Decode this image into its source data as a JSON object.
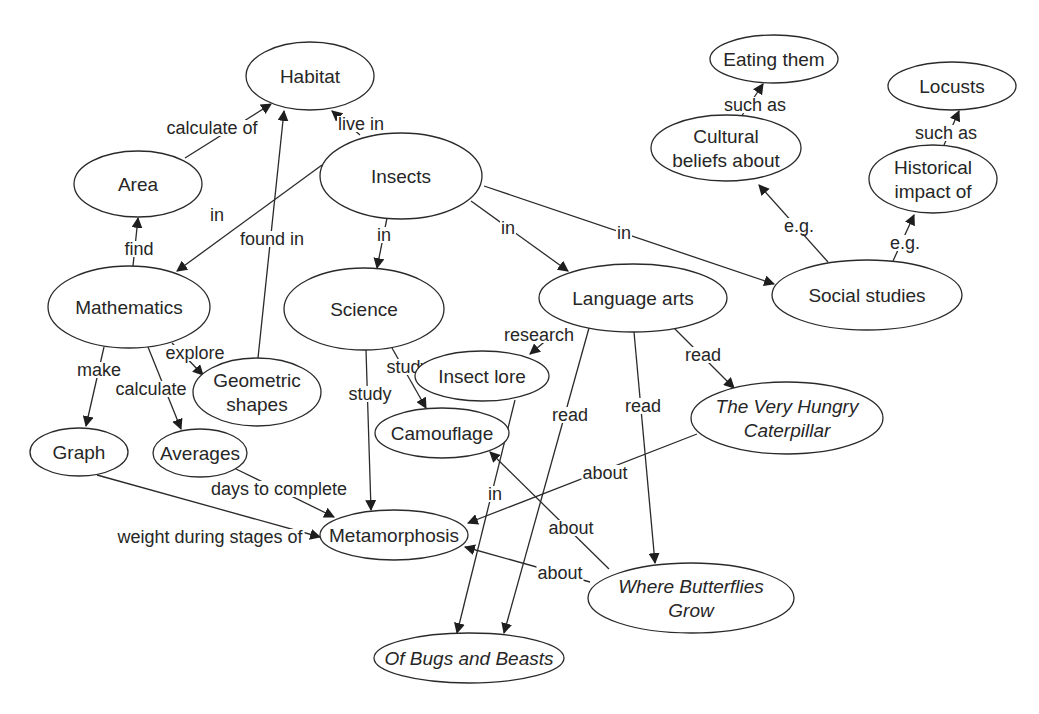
{
  "diagram": {
    "type": "concept-map",
    "central_topic": "Insects",
    "nodes": [
      {
        "id": "habitat",
        "label": "Habitat",
        "lines": [
          "Habitat"
        ],
        "italic": false,
        "cx": 310,
        "cy": 76,
        "rx": 64,
        "ry": 34
      },
      {
        "id": "area",
        "label": "Area",
        "lines": [
          "Area"
        ],
        "italic": false,
        "cx": 138,
        "cy": 184,
        "rx": 64,
        "ry": 33
      },
      {
        "id": "insects",
        "label": "Insects",
        "lines": [
          "Insects"
        ],
        "italic": false,
        "cx": 401,
        "cy": 176,
        "rx": 81,
        "ry": 43
      },
      {
        "id": "mathematics",
        "label": "Mathematics",
        "lines": [
          "Mathematics"
        ],
        "italic": false,
        "cx": 129,
        "cy": 307,
        "rx": 81,
        "ry": 41
      },
      {
        "id": "science",
        "label": "Science",
        "lines": [
          "Science"
        ],
        "italic": false,
        "cx": 364,
        "cy": 309,
        "rx": 80,
        "ry": 41
      },
      {
        "id": "language-arts",
        "label": "Language arts",
        "lines": [
          "Language arts"
        ],
        "italic": false,
        "cx": 633,
        "cy": 298,
        "rx": 94,
        "ry": 34
      },
      {
        "id": "social-studies",
        "label": "Social studies",
        "lines": [
          "Social studies"
        ],
        "italic": false,
        "cx": 867,
        "cy": 295,
        "rx": 95,
        "ry": 35
      },
      {
        "id": "eating-them",
        "label": "Eating them",
        "lines": [
          "Eating them"
        ],
        "italic": false,
        "cx": 774,
        "cy": 59,
        "rx": 64,
        "ry": 24
      },
      {
        "id": "locusts",
        "label": "Locusts",
        "lines": [
          "Locusts"
        ],
        "italic": false,
        "cx": 952,
        "cy": 86,
        "rx": 64,
        "ry": 24
      },
      {
        "id": "cultural-beliefs",
        "label": "Cultural beliefs about",
        "lines": [
          "Cultural",
          "beliefs about"
        ],
        "italic": false,
        "cx": 726,
        "cy": 148,
        "rx": 75,
        "ry": 33
      },
      {
        "id": "historical-impact",
        "label": "Historical impact of",
        "lines": [
          "Historical",
          "impact of"
        ],
        "italic": false,
        "cx": 933,
        "cy": 179,
        "rx": 64,
        "ry": 34
      },
      {
        "id": "geometric-shapes",
        "label": "Geometric shapes",
        "lines": [
          "Geometric",
          "shapes"
        ],
        "italic": false,
        "cx": 257,
        "cy": 392,
        "rx": 64,
        "ry": 34
      },
      {
        "id": "insect-lore",
        "label": "Insect lore",
        "lines": [
          "Insect lore"
        ],
        "italic": false,
        "cx": 482,
        "cy": 376,
        "rx": 67,
        "ry": 25
      },
      {
        "id": "very-hungry-caterpillar",
        "label": "The Very Hungry Caterpillar",
        "lines": [
          "The Very Hungry",
          "Caterpillar"
        ],
        "italic": true,
        "cx": 787,
        "cy": 418,
        "rx": 96,
        "ry": 36
      },
      {
        "id": "graph",
        "label": "Graph",
        "lines": [
          "Graph"
        ],
        "italic": false,
        "cx": 79,
        "cy": 452,
        "rx": 49,
        "ry": 24
      },
      {
        "id": "averages",
        "label": "Averages",
        "lines": [
          "Averages"
        ],
        "italic": false,
        "cx": 200,
        "cy": 453,
        "rx": 47,
        "ry": 24
      },
      {
        "id": "camouflage",
        "label": "Camouflage",
        "lines": [
          "Camouflage"
        ],
        "italic": false,
        "cx": 442,
        "cy": 433,
        "rx": 67,
        "ry": 25
      },
      {
        "id": "metamorphosis",
        "label": "Metamorphosis",
        "lines": [
          "Metamorphosis"
        ],
        "italic": false,
        "cx": 394,
        "cy": 535,
        "rx": 74,
        "ry": 25
      },
      {
        "id": "where-butterflies-grow",
        "label": "Where Butterflies Grow",
        "lines": [
          "Where Butterflies",
          "Grow"
        ],
        "italic": true,
        "cx": 691,
        "cy": 598,
        "rx": 103,
        "ry": 35
      },
      {
        "id": "of-bugs-and-beasts",
        "label": "Of Bugs and Beasts",
        "lines": [
          "Of Bugs and Beasts"
        ],
        "italic": true,
        "cx": 469,
        "cy": 658,
        "rx": 95,
        "ry": 25
      }
    ],
    "edges": [
      {
        "from": "insects",
        "to": "habitat",
        "label": "live in",
        "x1": 360,
        "y1": 135,
        "x2": 332,
        "y2": 111,
        "lx": 361,
        "ly": 124
      },
      {
        "from": "area",
        "to": "habitat",
        "label": "calculate of",
        "x1": 185,
        "y1": 158,
        "x2": 271,
        "y2": 104,
        "lx": 212,
        "ly": 128
      },
      {
        "from": "geometric-shapes",
        "to": "habitat",
        "label": "found in",
        "x1": 258,
        "y1": 358,
        "x2": 284,
        "y2": 111,
        "lx": 272,
        "ly": 239
      },
      {
        "from": "mathematics",
        "to": "area",
        "label": "find",
        "x1": 133,
        "y1": 266,
        "x2": 138,
        "y2": 218,
        "lx": 139,
        "ly": 249
      },
      {
        "from": "insects",
        "to": "mathematics",
        "label": "in",
        "x1": 322,
        "y1": 165,
        "x2": 177,
        "y2": 271,
        "lx": 217,
        "ly": 215
      },
      {
        "from": "insects",
        "to": "science",
        "label": "in",
        "x1": 387,
        "y1": 218,
        "x2": 377,
        "y2": 268,
        "lx": 384,
        "ly": 235
      },
      {
        "from": "insects",
        "to": "language-arts",
        "label": "in",
        "x1": 471,
        "y1": 201,
        "x2": 568,
        "y2": 271,
        "lx": 508,
        "ly": 228
      },
      {
        "from": "insects",
        "to": "social-studies",
        "label": "in",
        "x1": 484,
        "y1": 186,
        "x2": 774,
        "y2": 284,
        "lx": 624,
        "ly": 233
      },
      {
        "from": "social-studies",
        "to": "cultural-beliefs",
        "label": "e.g.",
        "x1": 828,
        "y1": 262,
        "x2": 759,
        "y2": 185,
        "lx": 799,
        "ly": 226
      },
      {
        "from": "social-studies",
        "to": "historical-impact",
        "label": "e.g.",
        "x1": 893,
        "y1": 261,
        "x2": 914,
        "y2": 215,
        "lx": 905,
        "ly": 243
      },
      {
        "from": "cultural-beliefs",
        "to": "eating-them",
        "label": "such as",
        "x1": 741,
        "y1": 117,
        "x2": 763,
        "y2": 84,
        "lx": 755,
        "ly": 105
      },
      {
        "from": "historical-impact",
        "to": "locusts",
        "label": "such as",
        "x1": 944,
        "y1": 145,
        "x2": 959,
        "y2": 111,
        "lx": 946,
        "ly": 133
      },
      {
        "from": "mathematics",
        "to": "geometric-shapes",
        "label": "explore",
        "x1": 172,
        "y1": 343,
        "x2": 203,
        "y2": 375,
        "lx": 195,
        "ly": 353
      },
      {
        "from": "mathematics",
        "to": "graph",
        "label": "make",
        "x1": 104,
        "y1": 347,
        "x2": 86,
        "y2": 426,
        "lx": 99,
        "ly": 370
      },
      {
        "from": "mathematics",
        "to": "averages",
        "label": "calculate",
        "x1": 148,
        "y1": 347,
        "x2": 181,
        "y2": 429,
        "lx": 151,
        "ly": 389
      },
      {
        "from": "science",
        "to": "camouflage",
        "label": "study",
        "x1": 392,
        "y1": 348,
        "x2": 426,
        "y2": 408,
        "lx": 408,
        "ly": 367
      },
      {
        "from": "science",
        "to": "metamorphosis",
        "label": "study",
        "x1": 366,
        "y1": 350,
        "x2": 371,
        "y2": 510,
        "lx": 370,
        "ly": 394
      },
      {
        "from": "language-arts",
        "to": "insect-lore",
        "label": "research",
        "x1": 555,
        "y1": 333,
        "x2": 530,
        "y2": 354,
        "lx": 539,
        "ly": 335
      },
      {
        "from": "language-arts",
        "to": "very-hungry-caterpillar",
        "label": "read",
        "x1": 674,
        "y1": 328,
        "x2": 734,
        "y2": 388,
        "lx": 703,
        "ly": 355
      },
      {
        "from": "language-arts",
        "to": "of-bugs-and-beasts",
        "label": "read",
        "x1": 589,
        "y1": 328,
        "x2": 504,
        "y2": 633,
        "lx": 570,
        "ly": 415
      },
      {
        "from": "language-arts",
        "to": "where-butterflies-grow",
        "label": "read",
        "x1": 634,
        "y1": 332,
        "x2": 655,
        "y2": 563,
        "lx": 643,
        "ly": 406
      },
      {
        "from": "insect-lore",
        "to": "of-bugs-and-beasts",
        "label": "in",
        "x1": 515,
        "y1": 400,
        "x2": 457,
        "y2": 633,
        "lx": 495,
        "ly": 494
      },
      {
        "from": "very-hungry-caterpillar",
        "to": "metamorphosis",
        "label": "about",
        "x1": 697,
        "y1": 434,
        "x2": 468,
        "y2": 523,
        "lx": 605,
        "ly": 473
      },
      {
        "from": "where-butterflies-grow",
        "to": "camouflage",
        "label": "about",
        "x1": 609,
        "y1": 569,
        "x2": 490,
        "y2": 452,
        "lx": 571,
        "ly": 528
      },
      {
        "from": "where-butterflies-grow",
        "to": "metamorphosis",
        "label": "about",
        "x1": 590,
        "y1": 582,
        "x2": 465,
        "y2": 547,
        "lx": 560,
        "ly": 573
      },
      {
        "from": "averages",
        "to": "metamorphosis",
        "label": "days to complete",
        "x1": 234,
        "y1": 468,
        "x2": 334,
        "y2": 517,
        "lx": 279,
        "ly": 489
      },
      {
        "from": "graph",
        "to": "metamorphosis",
        "label": "weight during stages of",
        "x1": 97,
        "y1": 475,
        "x2": 320,
        "y2": 537,
        "lx": 210,
        "ly": 537
      }
    ]
  },
  "colors": {
    "stroke": "#2a2a2a",
    "text": "#262626",
    "background": "#ffffff"
  }
}
